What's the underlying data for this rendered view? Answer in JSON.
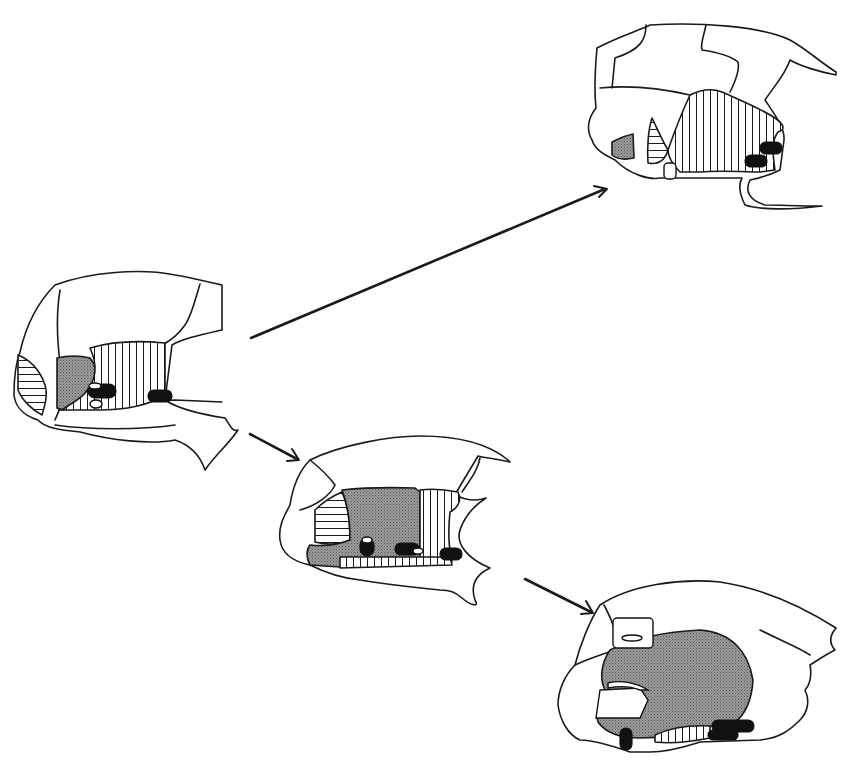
{
  "figure": {
    "panels": [
      {
        "id": "panel-left",
        "position": "middle-left"
      },
      {
        "id": "panel-top-right",
        "position": "top-right"
      },
      {
        "id": "panel-middle",
        "position": "center"
      },
      {
        "id": "panel-bottom-right",
        "position": "bottom-right"
      }
    ],
    "arrows": [
      {
        "from": "panel-left",
        "to": "panel-top-right"
      },
      {
        "from": "panel-left",
        "to": "panel-middle"
      },
      {
        "from": "panel-middle",
        "to": "panel-bottom-right"
      }
    ],
    "fill_patterns": {
      "stipple_gray": "#8c8c8c",
      "vertical_hatch": "#1a1a1a",
      "horizontal_hatch": "#1a1a1a",
      "solid_black": "#111111"
    }
  }
}
